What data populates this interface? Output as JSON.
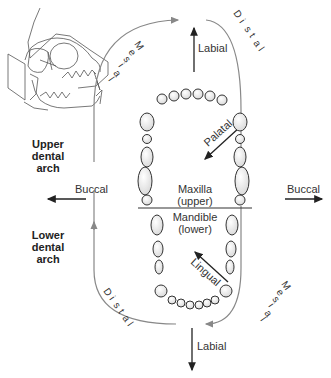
{
  "diagram": {
    "title_left_upper": [
      "Upper",
      "dental",
      "arch"
    ],
    "title_left_lower": [
      "Lower",
      "dental",
      "arch"
    ],
    "labels": {
      "labial_top": "Labial",
      "labial_bottom": "Labial",
      "buccal_left": "Buccal",
      "buccal_right": "Buccal",
      "palatal": "Palatal",
      "lingual": "Lingual",
      "maxilla": "Maxilla",
      "maxilla_sub": "(upper)",
      "mandible": "Mandible",
      "mandible_sub": "(lower)"
    },
    "direction_letters": {
      "mesial": [
        "M",
        "e",
        "s",
        "i",
        "a",
        "l"
      ],
      "distal": [
        "D",
        "i",
        "s",
        "t",
        "a",
        "l"
      ]
    },
    "icons": [
      "cat-skull-icon"
    ],
    "colors": {
      "arc": "#888888",
      "arrow": "#222222",
      "tooth_fill": "#f2f2f2",
      "tooth_stroke": "#333333"
    }
  }
}
